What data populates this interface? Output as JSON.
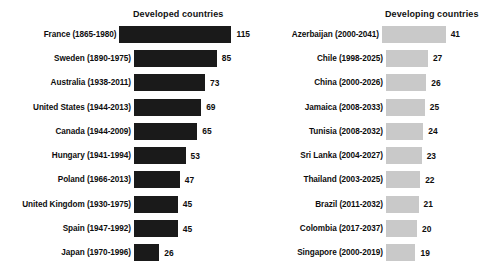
{
  "chart_data": {
    "type": "bar",
    "title": "",
    "xlabel": "",
    "ylabel": "",
    "orientation": "horizontal",
    "grid": false,
    "legend": "none",
    "panels": [
      {
        "name": "developed",
        "title": "Developed countries",
        "bar_color": "#1a1a1a",
        "axis_max": 115,
        "categories": [
          "France (1865-1980)",
          "Sweden (1890-1975)",
          "Australia (1938-2011)",
          "United States (1944-2013)",
          "Canada (1944-2009)",
          "Hungary (1941-1994)",
          "Poland (1966-2013)",
          "United Kingdom (1930-1975)",
          "Spain (1947-1992)",
          "Japan (1970-1996)"
        ],
        "values": [
          115,
          85,
          73,
          69,
          65,
          53,
          47,
          45,
          45,
          26
        ]
      },
      {
        "name": "developing",
        "title": "Developing countries",
        "bar_color": "#c9c9c9",
        "axis_max": 115,
        "categories": [
          "Azerbaijan (2000-2041)",
          "Chile (1998-2025)",
          "China (2000-2026)",
          "Jamaica (2008-2033)",
          "Tunisia (2008-2032)",
          "Sri Lanka (2004-2027)",
          "Thailand (2003-2025)",
          "Brazil (2011-2032)",
          "Colombia (2017-2037)",
          "Singapore (2000-2019)"
        ],
        "values": [
          41,
          27,
          26,
          25,
          24,
          23,
          22,
          21,
          20,
          19
        ]
      }
    ]
  }
}
